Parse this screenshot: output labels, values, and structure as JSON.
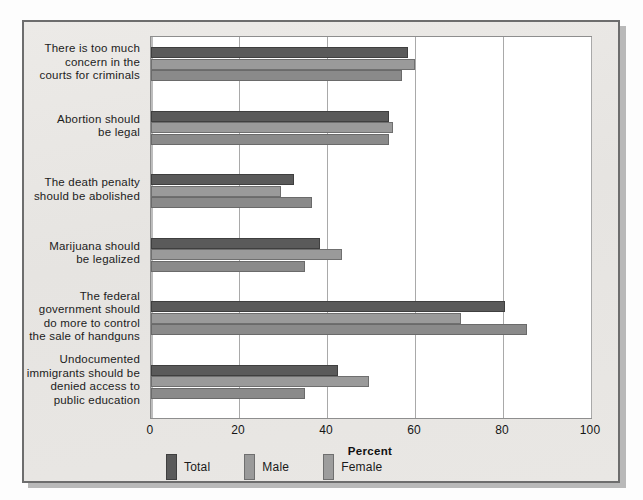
{
  "chart_data": {
    "type": "bar",
    "orientation": "horizontal",
    "title": "",
    "xlabel": "Percent",
    "ylabel": "",
    "xlim": [
      0,
      100
    ],
    "xticks": [
      "0",
      "20",
      "40",
      "60",
      "80",
      "100"
    ],
    "grid": true,
    "legend_position": "bottom",
    "categories": [
      "There is too much concern in the courts for criminals",
      "Abortion should be legal",
      "The death penalty should be abolished",
      "Marijuana should be legalized",
      "The federal government should do more to control the sale of handguns",
      "Undocumented immigrants should be denied access to public education"
    ],
    "category_lines": [
      [
        "There is too much",
        "concern in the",
        "courts for criminals"
      ],
      [
        "Abortion should",
        "be legal"
      ],
      [
        "The death penalty",
        "should be abolished"
      ],
      [
        "Marijuana should",
        "be legalized"
      ],
      [
        "The federal",
        "government should",
        "do more to control",
        "the sale of handguns"
      ],
      [
        "Undocumented",
        "immigrants should be",
        "denied access to",
        "public education"
      ]
    ],
    "series": [
      {
        "name": "Total",
        "color": "#5a5a5a",
        "values": [
          58.5,
          54.0,
          32.5,
          38.5,
          80.5,
          42.5
        ]
      },
      {
        "name": "Male",
        "color": "#9a9a9a",
        "values": [
          60.0,
          55.0,
          29.5,
          43.5,
          70.5,
          49.5
        ]
      },
      {
        "name": "Female",
        "color": "#8a8a8a",
        "values": [
          57.0,
          54.0,
          36.5,
          35.0,
          85.5,
          35.0
        ]
      }
    ]
  },
  "legend": {
    "items": [
      {
        "label": "Total",
        "swatch": "legend-swatch-total"
      },
      {
        "label": "Male",
        "swatch": "legend-swatch-male"
      },
      {
        "label": "Female",
        "swatch": "legend-swatch-female"
      }
    ]
  },
  "axis": {
    "x_title": "Percent"
  },
  "colors": {
    "total": "#5a5a5a",
    "male": "#9a9a9a",
    "female": "#8a8a8a",
    "page_background": "#fdfdfd",
    "figure_background": "#e8e7e4",
    "plot_background": "#ffffff",
    "frame_border": "#6d6d6d",
    "gridline": "#a9a9a9"
  }
}
